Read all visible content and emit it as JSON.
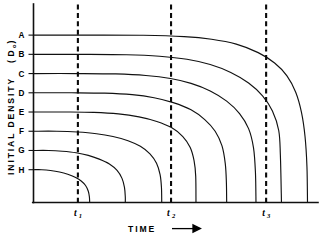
{
  "chart_data": {
    "type": "line",
    "title": "",
    "xlabel": "TIME",
    "xlabel_arrow": "⟶",
    "ylabel": "INITIAL  DENSITY",
    "ylabel_unit_open": "(",
    "ylabel_unit_symbol": "D",
    "ylabel_unit_subscript": "o",
    "ylabel_unit_close": ")",
    "grid": false,
    "legend_position": "none",
    "xlim": [
      0,
      1
    ],
    "ylim": [
      0,
      1
    ],
    "axis_style": "open-L-frame",
    "background_color": "#ffffff",
    "line_color": "#111111",
    "reference_line_color": "#0a0a0a",
    "y_tick_labels": [
      "A",
      "B",
      "C",
      "D",
      "E",
      "F",
      "G",
      "H"
    ],
    "y_tick_values": [
      0.888,
      0.786,
      0.684,
      0.582,
      0.48,
      0.378,
      0.276,
      0.174
    ],
    "x_tick_labels": [
      "t₁",
      "t₂",
      "t₃"
    ],
    "x_tick_values": [
      0.162,
      0.502,
      0.849
    ],
    "reference_lines": [
      {
        "label_base": "t",
        "label_sub": "1",
        "x": 0.162
      },
      {
        "label_base": "t",
        "label_sub": "2",
        "x": 0.502
      },
      {
        "label_base": "t",
        "label_sub": "3",
        "x": 0.849
      }
    ],
    "series": [
      {
        "name": "A",
        "y0": 0.888,
        "x_intercept": 1.0,
        "points": [
          [
            0.0,
            0.888
          ],
          [
            0.2,
            0.888
          ],
          [
            0.4,
            0.887
          ],
          [
            0.55,
            0.88
          ],
          [
            0.65,
            0.866
          ],
          [
            0.74,
            0.84
          ],
          [
            0.82,
            0.795
          ],
          [
            0.88,
            0.74
          ],
          [
            0.925,
            0.672
          ],
          [
            0.957,
            0.585
          ],
          [
            0.978,
            0.478
          ],
          [
            0.991,
            0.35
          ],
          [
            0.998,
            0.19
          ],
          [
            1.0,
            0.0
          ]
        ]
      },
      {
        "name": "B",
        "y0": 0.786,
        "x_intercept": 0.905,
        "points": [
          [
            0.0,
            0.786
          ],
          [
            0.18,
            0.786
          ],
          [
            0.34,
            0.784
          ],
          [
            0.46,
            0.776
          ],
          [
            0.56,
            0.76
          ],
          [
            0.645,
            0.732
          ],
          [
            0.72,
            0.69
          ],
          [
            0.785,
            0.634
          ],
          [
            0.836,
            0.566
          ],
          [
            0.872,
            0.485
          ],
          [
            0.895,
            0.382
          ],
          [
            0.901,
            0.252
          ],
          [
            0.905,
            0.0
          ]
        ]
      },
      {
        "name": "C",
        "y0": 0.684,
        "x_intercept": 0.812,
        "points": [
          [
            0.0,
            0.684
          ],
          [
            0.16,
            0.684
          ],
          [
            0.3,
            0.682
          ],
          [
            0.41,
            0.674
          ],
          [
            0.5,
            0.658
          ],
          [
            0.575,
            0.632
          ],
          [
            0.645,
            0.592
          ],
          [
            0.705,
            0.538
          ],
          [
            0.752,
            0.472
          ],
          [
            0.785,
            0.392
          ],
          [
            0.803,
            0.29
          ],
          [
            0.81,
            0.16
          ],
          [
            0.812,
            0.0
          ]
        ]
      },
      {
        "name": "D",
        "y0": 0.582,
        "x_intercept": 0.705,
        "points": [
          [
            0.0,
            0.582
          ],
          [
            0.14,
            0.582
          ],
          [
            0.26,
            0.58
          ],
          [
            0.36,
            0.572
          ],
          [
            0.44,
            0.556
          ],
          [
            0.51,
            0.53
          ],
          [
            0.575,
            0.492
          ],
          [
            0.625,
            0.44
          ],
          [
            0.663,
            0.378
          ],
          [
            0.688,
            0.3
          ],
          [
            0.7,
            0.205
          ],
          [
            0.704,
            0.105
          ],
          [
            0.705,
            0.0
          ]
        ]
      },
      {
        "name": "E",
        "y0": 0.48,
        "x_intercept": 0.593,
        "points": [
          [
            0.0,
            0.48
          ],
          [
            0.12,
            0.48
          ],
          [
            0.22,
            0.478
          ],
          [
            0.31,
            0.47
          ],
          [
            0.385,
            0.454
          ],
          [
            0.45,
            0.43
          ],
          [
            0.505,
            0.396
          ],
          [
            0.545,
            0.35
          ],
          [
            0.572,
            0.292
          ],
          [
            0.586,
            0.222
          ],
          [
            0.592,
            0.14
          ],
          [
            0.593,
            0.0
          ]
        ]
      },
      {
        "name": "F",
        "y0": 0.378,
        "x_intercept": 0.468,
        "points": [
          [
            0.0,
            0.378
          ],
          [
            0.085,
            0.378
          ],
          [
            0.16,
            0.374
          ],
          [
            0.23,
            0.365
          ],
          [
            0.29,
            0.35
          ],
          [
            0.345,
            0.328
          ],
          [
            0.39,
            0.298
          ],
          [
            0.425,
            0.258
          ],
          [
            0.449,
            0.208
          ],
          [
            0.462,
            0.148
          ],
          [
            0.467,
            0.08
          ],
          [
            0.468,
            0.0
          ]
        ]
      },
      {
        "name": "G",
        "y0": 0.276,
        "x_intercept": 0.335,
        "points": [
          [
            0.0,
            0.276
          ],
          [
            0.055,
            0.276
          ],
          [
            0.105,
            0.272
          ],
          [
            0.155,
            0.264
          ],
          [
            0.2,
            0.25
          ],
          [
            0.24,
            0.23
          ],
          [
            0.277,
            0.204
          ],
          [
            0.305,
            0.17
          ],
          [
            0.323,
            0.128
          ],
          [
            0.332,
            0.08
          ],
          [
            0.335,
            0.03
          ],
          [
            0.335,
            0.0
          ]
        ]
      },
      {
        "name": "H",
        "y0": 0.174,
        "x_intercept": 0.205,
        "points": [
          [
            0.0,
            0.174
          ],
          [
            0.03,
            0.174
          ],
          [
            0.062,
            0.17
          ],
          [
            0.095,
            0.162
          ],
          [
            0.125,
            0.15
          ],
          [
            0.152,
            0.134
          ],
          [
            0.174,
            0.114
          ],
          [
            0.19,
            0.09
          ],
          [
            0.2,
            0.06
          ],
          [
            0.204,
            0.03
          ],
          [
            0.205,
            0.0
          ]
        ]
      }
    ]
  }
}
